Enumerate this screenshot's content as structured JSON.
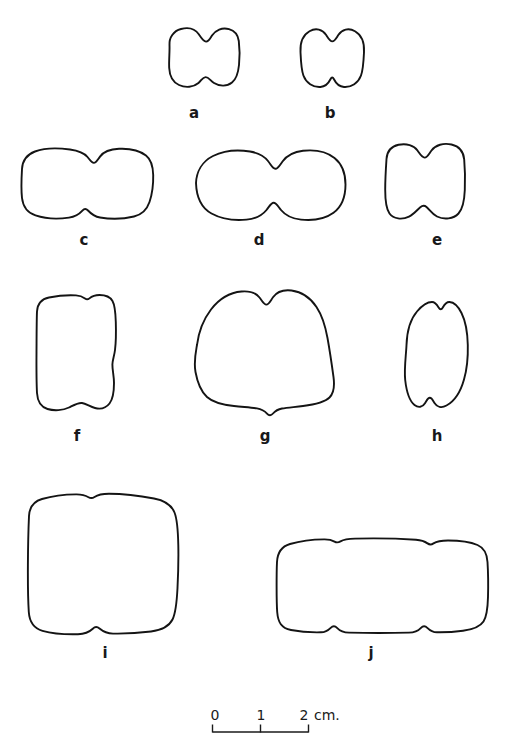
{
  "figure": {
    "kind": "line-drawing-plate",
    "background_color": "#ffffff",
    "ink_color": "#141414"
  },
  "specimens": [
    {
      "id": "a",
      "label": "a",
      "label_x": 194,
      "label_y": 113,
      "row": 1
    },
    {
      "id": "b",
      "label": "b",
      "label_x": 330,
      "label_y": 113,
      "row": 1
    },
    {
      "id": "c",
      "label": "c",
      "label_x": 84,
      "label_y": 240,
      "row": 2
    },
    {
      "id": "d",
      "label": "d",
      "label_x": 259,
      "label_y": 240,
      "row": 2
    },
    {
      "id": "e",
      "label": "e",
      "label_x": 437,
      "label_y": 240,
      "row": 2
    },
    {
      "id": "f",
      "label": "f",
      "label_x": 77,
      "label_y": 436,
      "row": 3
    },
    {
      "id": "g",
      "label": "g",
      "label_x": 265,
      "label_y": 436,
      "row": 3
    },
    {
      "id": "h",
      "label": "h",
      "label_x": 437,
      "label_y": 436,
      "row": 3
    },
    {
      "id": "i",
      "label": "i",
      "label_x": 105,
      "label_y": 653,
      "row": 4
    },
    {
      "id": "j",
      "label": "j",
      "label_x": 371,
      "label_y": 653,
      "row": 4
    }
  ],
  "scale_bar": {
    "unit_label": "cm.",
    "ticks": [
      {
        "value": "0",
        "x": 0
      },
      {
        "value": "1",
        "x": 48
      },
      {
        "value": "2",
        "x": 96
      }
    ],
    "bar_left_px": 212,
    "bar_top_px": 724,
    "bar_length_px": 96,
    "total_cm": 2
  }
}
